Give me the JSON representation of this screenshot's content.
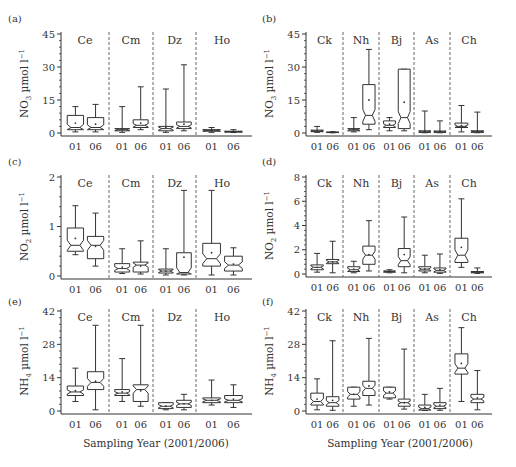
{
  "figure": {
    "xlabel": "Sampling Year (2001/2006)",
    "year_labels": [
      "01",
      "06"
    ]
  },
  "chart_data": [
    {
      "panel": "(a)",
      "type": "boxplot",
      "ylabel": "NO3 µmol l−1",
      "ylabel_main": "NO",
      "ylabel_sub": "3",
      "ylabel_unit": " µmol l",
      "ylabel_sup": "−1",
      "ylim": [
        0,
        45
      ],
      "yticks": [
        0,
        15,
        30,
        45
      ],
      "sites": [
        "Ce",
        "Cm",
        "Dz",
        "Ho"
      ],
      "boxes": [
        {
          "site": "Ce",
          "year": "01",
          "min": 0.5,
          "q1": 1.5,
          "median": 2.5,
          "q3": 8,
          "max": 12,
          "mean": 4.5
        },
        {
          "site": "Ce",
          "year": "06",
          "min": 0.5,
          "q1": 1.5,
          "median": 2.5,
          "q3": 7,
          "max": 13,
          "mean": 4
        },
        {
          "site": "Cm",
          "year": "01",
          "min": 0.3,
          "q1": 1,
          "median": 1.5,
          "q3": 2,
          "max": 12,
          "mean": 1.8
        },
        {
          "site": "Cm",
          "year": "06",
          "min": 1.5,
          "q1": 2.5,
          "median": 3.5,
          "q3": 6,
          "max": 21,
          "mean": 4.5
        },
        {
          "site": "Dz",
          "year": "01",
          "min": 0.3,
          "q1": 1,
          "median": 2,
          "q3": 3,
          "max": 20,
          "mean": 2.5
        },
        {
          "site": "Dz",
          "year": "06",
          "min": 1,
          "q1": 2,
          "median": 3,
          "q3": 5,
          "max": 31,
          "mean": 4
        },
        {
          "site": "Ho",
          "year": "01",
          "min": 0.3,
          "q1": 0.8,
          "median": 1.2,
          "q3": 1.5,
          "max": 2.5,
          "mean": 1.2
        },
        {
          "site": "Ho",
          "year": "06",
          "min": 0.2,
          "q1": 0.4,
          "median": 0.6,
          "q3": 0.8,
          "max": 1.5,
          "mean": 0.6
        }
      ]
    },
    {
      "panel": "(b)",
      "type": "boxplot",
      "ylabel": "NO3 µmol l−1",
      "ylabel_main": "NO",
      "ylabel_sub": "3",
      "ylabel_unit": " µmol l",
      "ylabel_sup": "−1",
      "ylim": [
        0,
        45
      ],
      "yticks": [
        0,
        15,
        30,
        45
      ],
      "sites": [
        "Ck",
        "Nh",
        "Bj",
        "As",
        "Ch"
      ],
      "boxes": [
        {
          "site": "Ck",
          "year": "01",
          "min": 0.3,
          "q1": 0.6,
          "median": 0.9,
          "q3": 1.3,
          "max": 3,
          "mean": 1
        },
        {
          "site": "Ck",
          "year": "06",
          "min": 0.1,
          "q1": 0.2,
          "median": 0.3,
          "q3": 0.4,
          "max": 0.6,
          "mean": 0.3
        },
        {
          "site": "Nh",
          "year": "01",
          "min": 0.5,
          "q1": 1,
          "median": 1.5,
          "q3": 2,
          "max": 7,
          "mean": 1.7
        },
        {
          "site": "Nh",
          "year": "06",
          "min": 1.5,
          "q1": 4,
          "median": 8,
          "q3": 22,
          "max": 38,
          "mean": 15
        },
        {
          "site": "Bj",
          "year": "01",
          "min": 1,
          "q1": 2.5,
          "median": 3.5,
          "q3": 5.5,
          "max": 7,
          "mean": 4
        },
        {
          "site": "Bj",
          "year": "06",
          "min": 1,
          "q1": 2,
          "median": 7,
          "q3": 29,
          "max": 29,
          "mean": 14
        },
        {
          "site": "As",
          "year": "01",
          "min": 0.1,
          "q1": 0.3,
          "median": 0.5,
          "q3": 1,
          "max": 10,
          "mean": 0.8
        },
        {
          "site": "As",
          "year": "06",
          "min": 0.1,
          "q1": 0.3,
          "median": 0.5,
          "q3": 0.9,
          "max": 5.5,
          "mean": 0.7
        },
        {
          "site": "Ch",
          "year": "01",
          "min": 0.5,
          "q1": 2.5,
          "median": 3,
          "q3": 4.5,
          "max": 12.5,
          "mean": 3.5
        },
        {
          "site": "Ch",
          "year": "06",
          "min": 0.1,
          "q1": 0.3,
          "median": 0.6,
          "q3": 1,
          "max": 9.5,
          "mean": 0.8
        }
      ]
    },
    {
      "panel": "(c)",
      "type": "boxplot",
      "ylabel": "NO2 µmol l−1",
      "ylabel_main": "NO",
      "ylabel_sub": "2",
      "ylabel_unit": " µmol l",
      "ylabel_sup": "−1",
      "ylim": [
        0,
        2
      ],
      "yticks": [
        0,
        1,
        2
      ],
      "sites": [
        "Ce",
        "Cm",
        "Dz",
        "Ho"
      ],
      "boxes": [
        {
          "site": "Ce",
          "year": "01",
          "min": 0.43,
          "q1": 0.5,
          "median": 0.62,
          "q3": 0.97,
          "max": 1.42,
          "mean": 0.76
        },
        {
          "site": "Ce",
          "year": "06",
          "min": 0.2,
          "q1": 0.35,
          "median": 0.62,
          "q3": 0.8,
          "max": 1.27,
          "mean": 0.6
        },
        {
          "site": "Cm",
          "year": "01",
          "min": 0.05,
          "q1": 0.08,
          "median": 0.15,
          "q3": 0.25,
          "max": 0.55,
          "mean": 0.18
        },
        {
          "site": "Cm",
          "year": "06",
          "min": 0.04,
          "q1": 0.08,
          "median": 0.22,
          "q3": 0.28,
          "max": 0.71,
          "mean": 0.2
        },
        {
          "site": "Dz",
          "year": "01",
          "min": 0.02,
          "q1": 0.06,
          "median": 0.1,
          "q3": 0.14,
          "max": 0.55,
          "mean": 0.1
        },
        {
          "site": "Dz",
          "year": "06",
          "min": 0.02,
          "q1": 0.04,
          "median": 0.07,
          "q3": 0.47,
          "max": 1.73,
          "mean": 0.38
        },
        {
          "site": "Ho",
          "year": "01",
          "min": 0.02,
          "q1": 0.2,
          "median": 0.35,
          "q3": 0.66,
          "max": 1.73,
          "mean": 0.47
        },
        {
          "site": "Ho",
          "year": "06",
          "min": 0.02,
          "q1": 0.1,
          "median": 0.22,
          "q3": 0.4,
          "max": 0.57,
          "mean": 0.24
        }
      ]
    },
    {
      "panel": "(d)",
      "type": "boxplot",
      "ylabel": "NO2 µmol l−1",
      "ylabel_main": "NO",
      "ylabel_sub": "2",
      "ylabel_unit": " µmol l",
      "ylabel_sup": "−1",
      "ylim": [
        0,
        8
      ],
      "yticks": [
        0,
        2,
        4,
        6,
        8
      ],
      "sites": [
        "Ck",
        "Nh",
        "Bj",
        "As",
        "Ch"
      ],
      "boxes": [
        {
          "site": "Ck",
          "year": "01",
          "min": 0.15,
          "q1": 0.35,
          "median": 0.55,
          "q3": 0.75,
          "max": 1.7,
          "mean": 0.55
        },
        {
          "site": "Ck",
          "year": "06",
          "min": 0.1,
          "q1": 0.85,
          "median": 1.0,
          "q3": 1.2,
          "max": 2.7,
          "mean": 1.0
        },
        {
          "site": "Nh",
          "year": "01",
          "min": 0.1,
          "q1": 0.2,
          "median": 0.35,
          "q3": 0.6,
          "max": 1.05,
          "mean": 0.4
        },
        {
          "site": "Nh",
          "year": "06",
          "min": 0.25,
          "q1": 0.8,
          "median": 1.55,
          "q3": 2.3,
          "max": 4.4,
          "mean": 1.6
        },
        {
          "site": "Bj",
          "year": "01",
          "min": 0.1,
          "q1": 0.15,
          "median": 0.2,
          "q3": 0.25,
          "max": 0.35,
          "mean": 0.2
        },
        {
          "site": "Bj",
          "year": "06",
          "min": 0.1,
          "q1": 0.6,
          "median": 1.1,
          "q3": 2.1,
          "max": 4.7,
          "mean": 1.6
        },
        {
          "site": "As",
          "year": "01",
          "min": 0.1,
          "q1": 0.25,
          "median": 0.4,
          "q3": 0.6,
          "max": 1.55,
          "mean": 0.42
        },
        {
          "site": "As",
          "year": "06",
          "min": 0.05,
          "q1": 0.15,
          "median": 0.3,
          "q3": 0.5,
          "max": 1.65,
          "mean": 0.35
        },
        {
          "site": "Ch",
          "year": "01",
          "min": 0.55,
          "q1": 0.95,
          "median": 1.55,
          "q3": 2.95,
          "max": 6.2,
          "mean": 2.2
        },
        {
          "site": "Ch",
          "year": "06",
          "min": 0.05,
          "q1": 0.1,
          "median": 0.15,
          "q3": 0.2,
          "max": 0.5,
          "mean": 0.15
        }
      ]
    },
    {
      "panel": "(e)",
      "type": "boxplot",
      "ylabel": "NH4 µmol l−1",
      "ylabel_main": "NH",
      "ylabel_sub": "4",
      "ylabel_unit": " µmol l",
      "ylabel_sup": "−1",
      "ylim": [
        0,
        42
      ],
      "yticks": [
        0,
        14,
        28,
        42
      ],
      "sites": [
        "Ce",
        "Cm",
        "Dz",
        "Ho"
      ],
      "boxes": [
        {
          "site": "Ce",
          "year": "01",
          "min": 4,
          "q1": 6.5,
          "median": 8,
          "q3": 10.5,
          "max": 18,
          "mean": 8.5
        },
        {
          "site": "Ce",
          "year": "06",
          "min": 0.5,
          "q1": 9,
          "median": 12,
          "q3": 16.5,
          "max": 36,
          "mean": 12.5
        },
        {
          "site": "Cm",
          "year": "01",
          "min": 4,
          "q1": 6.5,
          "median": 7.5,
          "q3": 9,
          "max": 22,
          "mean": 8
        },
        {
          "site": "Cm",
          "year": "06",
          "min": 2,
          "q1": 4,
          "median": 9,
          "q3": 11,
          "max": 36,
          "mean": 8.5
        },
        {
          "site": "Dz",
          "year": "01",
          "min": 0.5,
          "q1": 1,
          "median": 2,
          "q3": 3.5,
          "max": 3.5,
          "mean": 2
        },
        {
          "site": "Dz",
          "year": "06",
          "min": 0.5,
          "q1": 1.5,
          "median": 3,
          "q3": 4.5,
          "max": 7,
          "mean": 3
        },
        {
          "site": "Ho",
          "year": "01",
          "min": 2.5,
          "q1": 3.5,
          "median": 4.5,
          "q3": 5.5,
          "max": 13,
          "mean": 4.5
        },
        {
          "site": "Ho",
          "year": "06",
          "min": 1.5,
          "q1": 3.5,
          "median": 4.5,
          "q3": 6.5,
          "max": 11,
          "mean": 5
        }
      ]
    },
    {
      "panel": "(f)",
      "type": "boxplot",
      "ylabel": "NH4 µmol l−1",
      "ylabel_main": "NH",
      "ylabel_sub": "4",
      "ylabel_unit": " µmol l",
      "ylabel_sup": "−1",
      "ylim": [
        0,
        42
      ],
      "yticks": [
        0,
        14,
        28,
        42
      ],
      "sites": [
        "Ck",
        "Nh",
        "Bj",
        "As",
        "Ch"
      ],
      "boxes": [
        {
          "site": "Ck",
          "year": "01",
          "min": 0.5,
          "q1": 2.5,
          "median": 4,
          "q3": 7.5,
          "max": 13.5,
          "mean": 5
        },
        {
          "site": "Ck",
          "year": "06",
          "min": 0.3,
          "q1": 2,
          "median": 3.5,
          "q3": 6,
          "max": 29.5,
          "mean": 4.5
        },
        {
          "site": "Nh",
          "year": "01",
          "min": 2,
          "q1": 5,
          "median": 7,
          "q3": 10,
          "max": 10,
          "mean": 7
        },
        {
          "site": "Nh",
          "year": "06",
          "min": 2.5,
          "q1": 6.5,
          "median": 9.5,
          "q3": 12.5,
          "max": 30.5,
          "mean": 10.5
        },
        {
          "site": "Bj",
          "year": "01",
          "min": 5,
          "q1": 5.5,
          "median": 7.5,
          "q3": 10,
          "max": 10,
          "mean": 8
        },
        {
          "site": "Bj",
          "year": "06",
          "min": 0.8,
          "q1": 2,
          "median": 3.5,
          "q3": 5,
          "max": 26,
          "mean": 3.5
        },
        {
          "site": "As",
          "year": "01",
          "min": 0.2,
          "q1": 0.4,
          "median": 1,
          "q3": 2.5,
          "max": 7,
          "mean": 1.5
        },
        {
          "site": "As",
          "year": "06",
          "min": 0.3,
          "q1": 1,
          "median": 2,
          "q3": 3.5,
          "max": 9.5,
          "mean": 2.5
        },
        {
          "site": "Ch",
          "year": "01",
          "min": 4,
          "q1": 15.5,
          "median": 18,
          "q3": 24,
          "max": 35,
          "mean": 20
        },
        {
          "site": "Ch",
          "year": "06",
          "min": 0.5,
          "q1": 3.5,
          "median": 5,
          "q3": 7,
          "max": 17,
          "mean": 5.5
        }
      ]
    }
  ]
}
